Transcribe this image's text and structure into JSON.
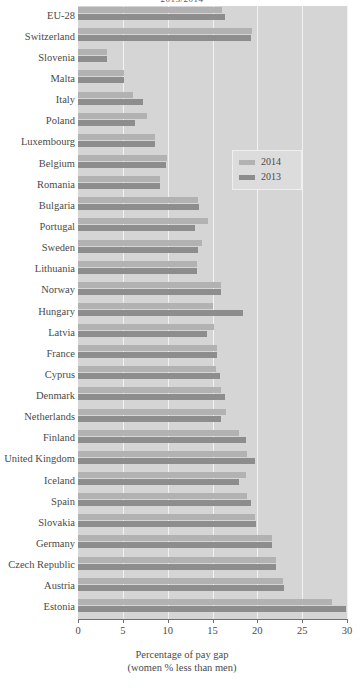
{
  "chart_data": {
    "type": "bar",
    "orientation": "horizontal",
    "title": "2013/2014",
    "xlabel": "Percentage of pay gap",
    "xlabel_line2": "(women % less than men)",
    "ylabel": "",
    "xlim": [
      0,
      30
    ],
    "xticks": [
      0,
      5,
      10,
      15,
      20,
      25,
      30
    ],
    "xtick_labels": [
      "0",
      "5",
      "10",
      "15",
      "20",
      "25",
      "30"
    ],
    "grid": true,
    "legend_position": "upper right inside",
    "categories": [
      "EU-28",
      "Switzerland",
      "Slovenia",
      "Malta",
      "Italy",
      "Poland",
      "Luxembourg",
      "Belgium",
      "Romania",
      "Bulgaria",
      "Portugal",
      "Sweden",
      "Lithuania",
      "Norway",
      "Hungary",
      "Latvia",
      "France",
      "Cyprus",
      "Denmark",
      "Netherlands",
      "Finland",
      "United Kingdom",
      "Iceland",
      "Spain",
      "Slovakia",
      "Germany",
      "Czech Republic",
      "Austria",
      "Estonia"
    ],
    "series": [
      {
        "name": "2014",
        "color": "#b2b2b2",
        "values": [
          16.1,
          19.4,
          3.2,
          5.1,
          6.1,
          7.7,
          8.6,
          9.9,
          9.1,
          13.4,
          14.5,
          13.8,
          13.3,
          16.0,
          15.1,
          15.2,
          15.5,
          15.4,
          16.0,
          16.5,
          18.0,
          18.8,
          18.7,
          18.8,
          19.7,
          21.6,
          22.1,
          22.9,
          28.3
        ]
      },
      {
        "name": "2013",
        "color": "#8d8d8d",
        "values": [
          16.4,
          19.3,
          3.2,
          5.1,
          7.3,
          6.4,
          8.6,
          9.8,
          9.1,
          13.5,
          13.0,
          13.4,
          13.3,
          16.0,
          18.4,
          14.4,
          15.5,
          15.8,
          16.4,
          16.0,
          18.7,
          19.7,
          18.0,
          19.3,
          19.8,
          21.6,
          22.1,
          23.0,
          29.9
        ]
      }
    ]
  },
  "legend": {
    "entries": [
      {
        "label": "2014",
        "color": "#b2b2b2"
      },
      {
        "label": "2013",
        "color": "#8d8d8d"
      }
    ]
  },
  "colors": {
    "plot_background": "#d5d5d5",
    "gridline": "#f2f2f2",
    "axis": "#6f6f6f",
    "text": "#4a4a4a",
    "series_2014": "#b2b2b2",
    "series_2013": "#8d8d8d"
  }
}
